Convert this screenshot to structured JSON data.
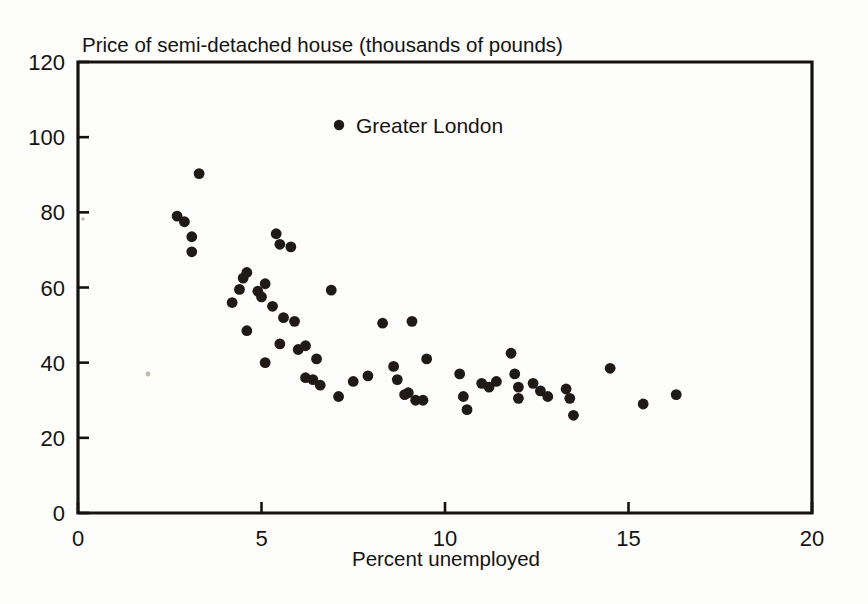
{
  "chart_data": {
    "type": "scatter",
    "title": "Price of semi-detached house (thousands of pounds)",
    "xlabel": "Percent unemployed",
    "ylabel": "Price of semi-detached house (thousands of pounds)",
    "xlim": [
      0,
      20
    ],
    "ylim": [
      0,
      120
    ],
    "xticks": [
      0,
      5,
      10,
      15,
      20
    ],
    "yticks": [
      0,
      20,
      40,
      60,
      80,
      100,
      120
    ],
    "xtick_labels": [
      "0",
      "5",
      "10",
      "15",
      "20"
    ],
    "ytick_labels": [
      "0",
      "20",
      "40",
      "60",
      "80",
      "100",
      "120"
    ],
    "grid": false,
    "legend": {
      "position": "inside-top-center",
      "entries": [
        {
          "label": "Greater London",
          "marker": "filled-circle",
          "color": "#201a16"
        }
      ]
    },
    "series": [
      {
        "name": "Greater London",
        "marker": "filled-circle",
        "color": "#201a16",
        "points": [
          [
            2.7,
            79.0
          ],
          [
            2.9,
            77.5
          ],
          [
            3.1,
            73.5
          ],
          [
            3.1,
            69.5
          ],
          [
            3.3,
            90.3
          ],
          [
            4.2,
            56.0
          ],
          [
            4.4,
            59.5
          ],
          [
            4.5,
            62.5
          ],
          [
            4.6,
            64.0
          ],
          [
            4.6,
            48.5
          ],
          [
            4.9,
            59.0
          ],
          [
            5.0,
            57.5
          ],
          [
            5.1,
            61.0
          ],
          [
            5.1,
            40.0
          ],
          [
            5.3,
            55.0
          ],
          [
            5.4,
            74.3
          ],
          [
            5.5,
            71.5
          ],
          [
            5.5,
            45.0
          ],
          [
            5.6,
            52.0
          ],
          [
            5.8,
            70.8
          ],
          [
            5.9,
            51.0
          ],
          [
            6.0,
            43.5
          ],
          [
            6.2,
            44.5
          ],
          [
            6.2,
            36.0
          ],
          [
            6.4,
            35.5
          ],
          [
            6.5,
            41.0
          ],
          [
            6.6,
            34.0
          ],
          [
            6.9,
            59.3
          ],
          [
            7.1,
            31.0
          ],
          [
            7.5,
            35.0
          ],
          [
            7.9,
            36.5
          ],
          [
            8.3,
            50.5
          ],
          [
            8.6,
            39.0
          ],
          [
            8.7,
            35.5
          ],
          [
            8.9,
            31.5
          ],
          [
            9.0,
            32.0
          ],
          [
            9.1,
            51.0
          ],
          [
            9.2,
            30.0
          ],
          [
            9.4,
            30.0
          ],
          [
            9.5,
            41.0
          ],
          [
            10.4,
            37.0
          ],
          [
            10.5,
            31.0
          ],
          [
            10.6,
            27.5
          ],
          [
            11.0,
            34.5
          ],
          [
            11.2,
            33.5
          ],
          [
            11.4,
            35.0
          ],
          [
            11.8,
            42.5
          ],
          [
            11.9,
            37.0
          ],
          [
            12.0,
            33.5
          ],
          [
            12.0,
            30.5
          ],
          [
            12.4,
            34.5
          ],
          [
            12.6,
            32.5
          ],
          [
            12.8,
            31.0
          ],
          [
            13.3,
            33.0
          ],
          [
            13.4,
            30.5
          ],
          [
            13.5,
            26.0
          ],
          [
            14.5,
            38.5
          ],
          [
            15.4,
            29.0
          ],
          [
            16.3,
            31.5
          ]
        ]
      }
    ]
  },
  "axes": {
    "x_title": "Percent unemployed",
    "top_title": "Price of semi-detached house (thousands of pounds)"
  }
}
